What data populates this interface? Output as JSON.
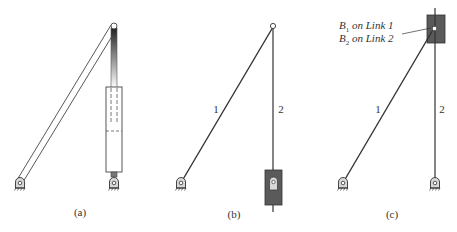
{
  "figure": {
    "panels": [
      {
        "id": "a",
        "caption": "(a)",
        "description": "Physical mechanism: a long bar from a ground pivot to a top joint, and a hydraulic cylinder (piston rod in cylinder) from a lower ground pivot to the same top joint"
      },
      {
        "id": "b",
        "caption": "(b)",
        "link_labels": [
          "1",
          "2"
        ],
        "description": "Kinematic skeleton: link 1 grounded at lower left pivot; link 2 slides through a pivoted slider block at bottom"
      },
      {
        "id": "c",
        "caption": "(c)",
        "link_labels": [
          "1",
          "2"
        ],
        "annotation_line1": "B",
        "annotation_line1_sub": "1",
        "annotation_line1_rest": " on Link 1",
        "annotation_line2": "B",
        "annotation_line2_sub": "2",
        "annotation_line2_rest": " on Link 2",
        "description": "Inverted skeleton: link 2 grounded at lower right pivot and passes through a slider block at top pinned to link 1"
      }
    ],
    "colors": {
      "line": "#333333",
      "block_fill": "#5a5a5a",
      "pivot_fill": "#d8d8d8",
      "background": "#ffffff"
    }
  }
}
